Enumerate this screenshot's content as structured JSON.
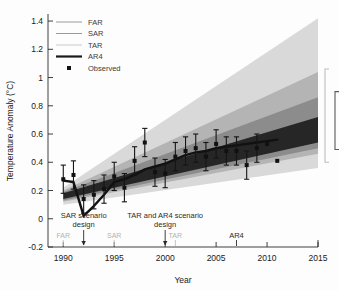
{
  "chart_data": {
    "type": "line",
    "title": "",
    "xlabel": "Year",
    "ylabel": "Temperature Anomaly (°C)",
    "xlim": [
      1988.5,
      2015
    ],
    "ylim": [
      -0.2,
      1.45
    ],
    "xticks": [
      1990,
      1995,
      2000,
      2005,
      2010,
      2015
    ],
    "xticklabels": [
      "1990",
      "1995",
      "2000",
      "2005",
      "2010",
      "2015"
    ],
    "yticks": [
      -0.2,
      0,
      0.2,
      0.4,
      0.6,
      0.8,
      1.0,
      1.2,
      1.4
    ],
    "yticklabels": [
      "-0.2",
      "0",
      "0.2",
      "0.4",
      "0.6",
      "0.8",
      "1",
      "1.2",
      "1.4"
    ],
    "grid": false,
    "legend_position": "upper-left",
    "legend": [
      {
        "label": "FAR",
        "type": "line",
        "color": "#9a9a9a"
      },
      {
        "label": "SAR",
        "type": "line",
        "color": "#9a9a9a"
      },
      {
        "label": "TAR",
        "type": "line",
        "color": "#c8c8c8"
      },
      {
        "label": "AR4",
        "type": "line",
        "color": "#1a1a1a"
      },
      {
        "label": "Observed",
        "type": "marker",
        "color": "#111111"
      }
    ],
    "bands": [
      {
        "name": "FAR range",
        "color": "#d9d9d9",
        "x": [
          1990,
          2015
        ],
        "upper": [
          0.22,
          1.42
        ],
        "lower": [
          0.1,
          0.36
        ]
      },
      {
        "name": "SAR range",
        "color": "#b4b4b4",
        "x": [
          1990,
          2015
        ],
        "upper": [
          0.2,
          1.04
        ],
        "lower": [
          0.12,
          0.46
        ]
      },
      {
        "name": "TAR range",
        "color": "#8c8c8c",
        "x": [
          1990,
          2015
        ],
        "upper": [
          0.19,
          0.86
        ],
        "lower": [
          0.13,
          0.5
        ]
      },
      {
        "name": "AR4 range",
        "color": "#262626",
        "x": [
          1990,
          2015
        ],
        "upper": [
          0.18,
          0.72
        ],
        "lower": [
          0.14,
          0.54
        ]
      }
    ],
    "observed_line": {
      "name": "Observed smoothed",
      "color": "#111111",
      "x": [
        1990,
        1991,
        1992,
        1993,
        1994,
        1995,
        1996,
        1997,
        1998,
        1999,
        2000,
        2001,
        2002,
        2003,
        2004,
        2005,
        2006,
        2007,
        2008,
        2009,
        2010,
        2011
      ],
      "y": [
        0.27,
        0.26,
        0.02,
        0.09,
        0.17,
        0.26,
        0.28,
        0.31,
        0.35,
        0.37,
        0.39,
        0.42,
        0.45,
        0.47,
        0.48,
        0.5,
        0.51,
        0.52,
        0.53,
        0.54,
        0.55,
        0.56
      ]
    },
    "observed_points": {
      "name": "Observed",
      "color": "#111111",
      "x": [
        1990,
        1991,
        1992,
        1993,
        1994,
        1995,
        1996,
        1997,
        1998,
        1999,
        2000,
        2001,
        2002,
        2003,
        2004,
        2005,
        2006,
        2007,
        2008,
        2009,
        2010,
        2011
      ],
      "y": [
        0.28,
        0.31,
        0.14,
        0.17,
        0.21,
        0.3,
        0.22,
        0.41,
        0.54,
        0.33,
        0.32,
        0.44,
        0.48,
        0.5,
        0.44,
        0.53,
        0.48,
        0.48,
        0.38,
        0.5,
        0.53,
        0.41
      ],
      "yerr": [
        0.1,
        0.1,
        0.1,
        0.1,
        0.1,
        0.1,
        0.1,
        0.1,
        0.1,
        0.1,
        0.1,
        0.1,
        0.1,
        0.1,
        0.1,
        0.1,
        0.1,
        0.1,
        0.1,
        0.1,
        0.0,
        0.0
      ]
    },
    "annotations": [
      {
        "name": "sar-scenario-design",
        "text_line1": "SAR scenario",
        "text_line2": "design",
        "year": 1992
      },
      {
        "name": "tar-ar4-scenario-design",
        "text_line1": "TAR and AR4 scenario",
        "text_line2": "design",
        "year": 2000
      },
      {
        "name": "far-marker",
        "text": "FAR",
        "year": 1990
      },
      {
        "name": "sar-marker",
        "text": "SAR",
        "year": 1995
      },
      {
        "name": "tar-marker",
        "text": "TAR",
        "year": 2001
      },
      {
        "name": "ar4-marker",
        "text": "AR4",
        "year": 2007
      }
    ],
    "range_brackets": [
      {
        "name": "outer-projection-bracket",
        "year": 2015,
        "low": 0.4,
        "high": 1.06,
        "color": "#bdbdbd"
      },
      {
        "name": "inner-projection-bracket",
        "year": 2015,
        "low": 0.49,
        "high": 0.9,
        "color": "#5a5a5a"
      }
    ],
    "caption_fragment": ""
  }
}
